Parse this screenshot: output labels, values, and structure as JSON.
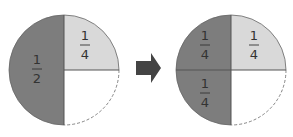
{
  "colors": {
    "dark_fill": "#7d7d7d",
    "light_fill": "#d9d9d9",
    "empty_fill": "#ffffff",
    "line": "#555555",
    "arrow": "#444444",
    "text": "#333333"
  },
  "left_circle": {
    "half": {
      "numerator": "1",
      "denominator": "2"
    },
    "quarter": {
      "numerator": "1",
      "denominator": "4"
    }
  },
  "right_circle": {
    "top_left": {
      "numerator": "1",
      "denominator": "4"
    },
    "top_right": {
      "numerator": "1",
      "denominator": "4"
    },
    "bottom_left": {
      "numerator": "1",
      "denominator": "4"
    }
  },
  "arrow": {
    "icon": "right-arrow-icon"
  }
}
